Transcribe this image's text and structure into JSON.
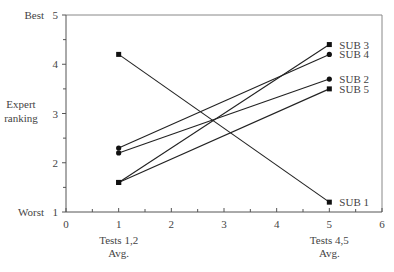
{
  "chart_data": {
    "type": "line",
    "title": "",
    "xlabel": "",
    "ylabel": "Expert ranking",
    "xlim": [
      0,
      6
    ],
    "ylim": [
      1,
      5
    ],
    "x_ticks": [
      0,
      1,
      2,
      3,
      4,
      5,
      6
    ],
    "x_minor_step": 0.5,
    "y_ticks": [
      1,
      2,
      3,
      4,
      5
    ],
    "y_minor_step": 0.5,
    "x_category_labels": [
      {
        "x": 1,
        "lines": [
          "Tests 1,2",
          "Avg."
        ]
      },
      {
        "x": 5,
        "lines": [
          "Tests 4,5",
          "Avg."
        ]
      }
    ],
    "y_annotations": [
      {
        "y": 5,
        "text": "Best"
      },
      {
        "y": 1,
        "text": "Worst"
      }
    ],
    "ylabel_lines": [
      "Expert",
      "ranking"
    ],
    "grid": false,
    "legend": "inline-right",
    "series": [
      {
        "name": "SUB 1",
        "x": [
          1,
          5
        ],
        "y": [
          4.2,
          1.2
        ],
        "marker": "square"
      },
      {
        "name": "SUB 2",
        "x": [
          1,
          5
        ],
        "y": [
          2.2,
          3.7
        ],
        "marker": "circle"
      },
      {
        "name": "SUB 3",
        "x": [
          1,
          5
        ],
        "y": [
          1.6,
          4.4
        ],
        "marker": "square"
      },
      {
        "name": "SUB 4",
        "x": [
          1,
          5
        ],
        "y": [
          2.3,
          4.2
        ],
        "marker": "circle"
      },
      {
        "name": "SUB 5",
        "x": [
          1,
          5
        ],
        "y": [
          1.6,
          3.5
        ],
        "marker": "square"
      }
    ],
    "colors": {
      "line": "#222222",
      "axis": "#555555",
      "text": "#444444"
    }
  }
}
